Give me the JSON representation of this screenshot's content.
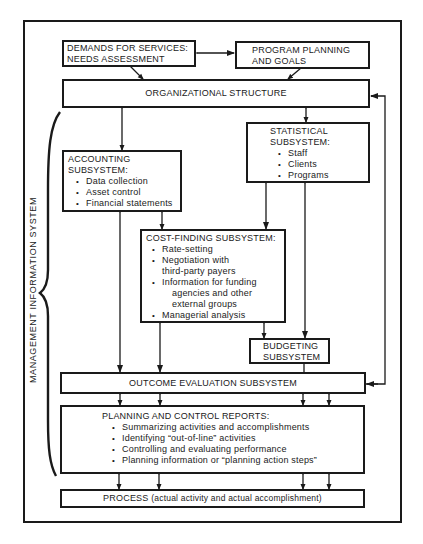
{
  "diagram": {
    "side_label": "MANAGEMENT INFORMATION SYSTEM",
    "nodes": {
      "demands": {
        "line1": "DEMANDS FOR SERVICES:",
        "line2": "NEEDS ASSESSMENT"
      },
      "program": {
        "line1": "PROGRAM PLANNING",
        "line2": "AND GOALS"
      },
      "org": {
        "label": "ORGANIZATIONAL STRUCTURE"
      },
      "accounting": {
        "title1": "ACCOUNTING",
        "title2": "SUBSYSTEM:",
        "items": [
          "Data collection",
          "Asset control",
          "Financial statements"
        ]
      },
      "statistical": {
        "title1": "STATISTICAL",
        "title2": "SUBSYSTEM:",
        "items": [
          "Staff",
          "Clients",
          "Programs"
        ]
      },
      "costfinding": {
        "title": "COST-FINDING SUBSYSTEM:",
        "items": [
          {
            "text": "Rate-setting"
          },
          {
            "text": "Negotiation with",
            "cont": "third-party payers"
          },
          {
            "text": "Information for funding",
            "cont": "agencies and other",
            "cont2": "external groups"
          },
          {
            "text": "Managerial analysis"
          }
        ]
      },
      "budgeting": {
        "line1": "BUDGETING",
        "line2": "SUBSYSTEM"
      },
      "outcome": {
        "label": "OUTCOME EVALUATION SUBSYSTEM"
      },
      "planning": {
        "title": "PLANNING AND CONTROL REPORTS:",
        "items": [
          "Summarizing activities and accomplishments",
          "Identifying “out-of-line” activities",
          "Controlling and evaluating performance",
          "Planning information or “planning action steps”"
        ]
      },
      "process": {
        "label": "PROCESS",
        "detail": "(actual activity and actual accomplishment)"
      }
    },
    "edges": [
      {
        "from": "demands",
        "to": "program",
        "type": "bidirectional"
      },
      {
        "from": "demands",
        "to": "org",
        "type": "directed"
      },
      {
        "from": "program",
        "to": "org",
        "type": "directed"
      },
      {
        "from": "org",
        "to": "accounting",
        "type": "bidirectional"
      },
      {
        "from": "org",
        "to": "statistical",
        "type": "bidirectional"
      },
      {
        "from": "accounting",
        "to": "costfinding",
        "type": "bidirectional"
      },
      {
        "from": "accounting",
        "to": "outcome",
        "type": "bidirectional"
      },
      {
        "from": "statistical",
        "to": "costfinding",
        "type": "bidirectional"
      },
      {
        "from": "statistical",
        "to": "budgeting",
        "type": "bidirectional"
      },
      {
        "from": "costfinding",
        "to": "outcome",
        "type": "bidirectional"
      },
      {
        "from": "costfinding",
        "to": "budgeting",
        "type": "bidirectional"
      },
      {
        "from": "budgeting",
        "to": "outcome",
        "type": "directed"
      },
      {
        "from": "outcome",
        "to": "org",
        "type": "feedback-bidirectional"
      },
      {
        "from": "outcome",
        "to": "planning",
        "type": "bidirectional",
        "count": 4
      },
      {
        "from": "planning",
        "to": "process",
        "type": "bidirectional",
        "count": 4
      }
    ]
  }
}
